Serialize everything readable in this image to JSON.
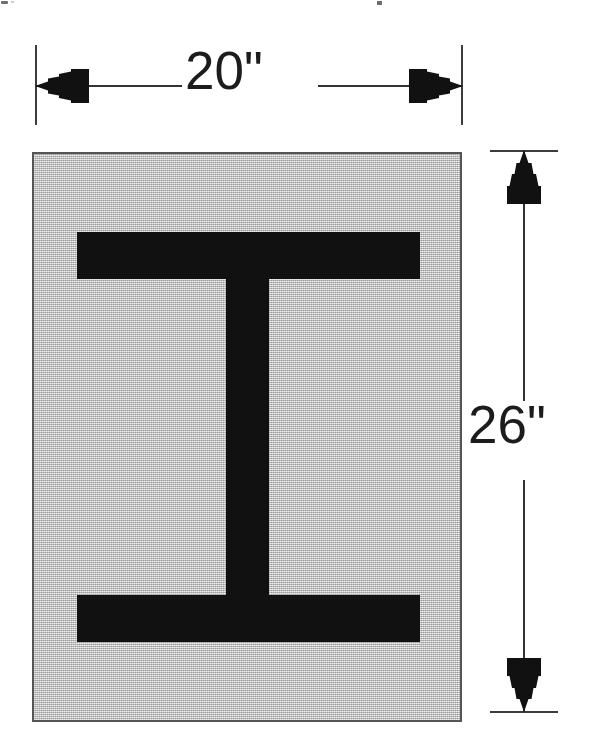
{
  "diagram": {
    "ink_color": "#111111",
    "plate_fill_color": "#bcbcbc",
    "line_color": "#333333",
    "dimensions": {
      "width": {
        "label": "20\"",
        "value": 20,
        "unit": "inches",
        "orientation": "horizontal",
        "position": "above"
      },
      "height": {
        "label": "26\"",
        "value": 26,
        "unit": "inches",
        "orientation": "vertical",
        "position": "right"
      }
    },
    "shape": {
      "name": "I-beam",
      "parts": [
        {
          "name": "top-flange",
          "fill": "#111111"
        },
        {
          "name": "web",
          "fill": "#111111"
        },
        {
          "name": "bottom-flange",
          "fill": "#111111"
        }
      ],
      "background_plate": {
        "name": "plate",
        "fill": "#bcbcbc"
      }
    }
  }
}
